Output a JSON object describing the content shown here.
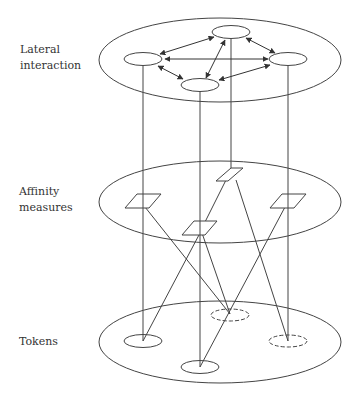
{
  "layers": [
    {
      "name": "lateral-interaction",
      "label": "Lateral\ninteraction"
    },
    {
      "name": "affinity-measures",
      "label": "Affinity\nmeasures"
    },
    {
      "name": "tokens",
      "label": "Tokens"
    }
  ],
  "colors": {
    "stroke": "#444444",
    "text": "#333333",
    "background": "#ffffff"
  },
  "structure": {
    "top_layer_nodes": 4,
    "middle_layer_nodes": 4,
    "bottom_layer_nodes": 5,
    "bottom_dashed_nodes": 2
  }
}
